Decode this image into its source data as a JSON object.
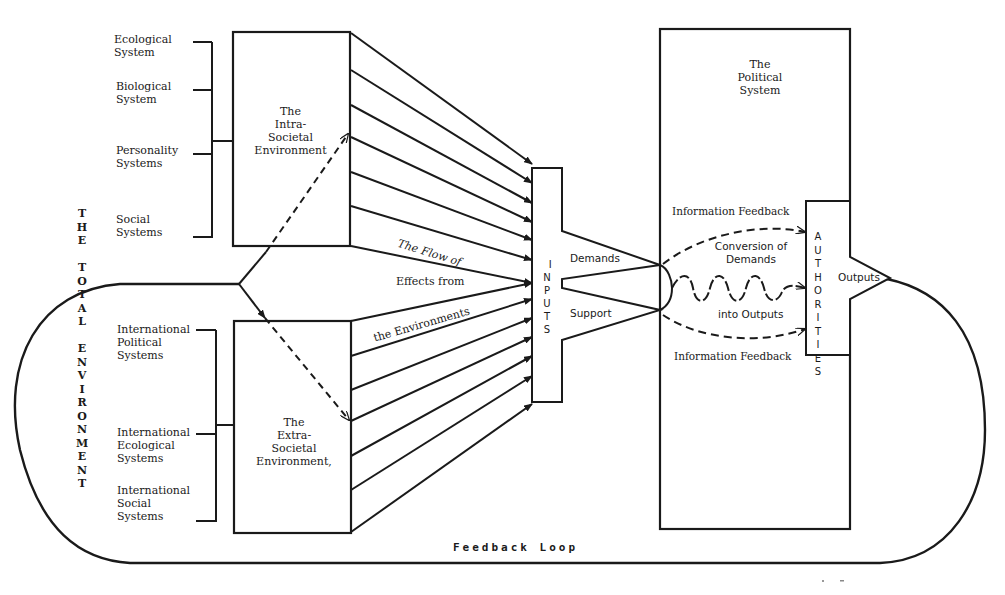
{
  "total_environment_label": "THE\nTOTAL\nENVIRONMENT",
  "intra_societal": {
    "box_label": "The\nIntra-\nSocietal\nEnvironment",
    "systems": [
      {
        "label": "Ecological\nSystem"
      },
      {
        "label": "Biological\nSystem"
      },
      {
        "label": "Personality\nSystems"
      },
      {
        "label": "Social\nSystems"
      }
    ]
  },
  "extra_societal": {
    "box_label": "The\nExtra-\nSocietal\nEnvironment,",
    "systems": [
      {
        "label": "International\nPolitical\nSystems"
      },
      {
        "label": "International\nEcological\nSystems"
      },
      {
        "label": "International\nSocial\nSystems"
      }
    ]
  },
  "flow": {
    "line1": "The Flow of",
    "line2": "Effects from",
    "line3": "the Environments"
  },
  "inputs": {
    "label": "INPUTS",
    "demands": "Demands",
    "support": "Support"
  },
  "political_system": {
    "title": "The\nPolitical\nSystem",
    "feedback_top": "Information Feedback",
    "feedback_bottom": "Information Feedback",
    "conversion_top": "Conversion of\nDemands",
    "conversion_bottom": "into Outputs"
  },
  "authorities": {
    "label": "AUTHORITIES",
    "outputs": "Outputs"
  },
  "feedback_loop": {
    "label": "Feedback Loop"
  },
  "colors": {
    "ink": "#1a1a1a",
    "paper": "#ffffff"
  }
}
